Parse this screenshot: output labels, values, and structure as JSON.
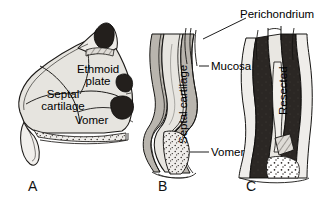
{
  "figure": {
    "background_color": "#ffffff",
    "ink_color": "#000000",
    "cartilage_fill": "#e3e1dc",
    "dark_fill": "#2b2724",
    "mucosa_fill": "#b9b5ae"
  },
  "panels": [
    {
      "letter": "A",
      "name": "septum-overview",
      "labels": [
        {
          "text": "Septal",
          "sub": "cartilage"
        },
        {
          "text": "Ethmoid",
          "sub": "plate"
        },
        {
          "text": "Vomer",
          "sub": ""
        }
      ]
    },
    {
      "letter": "B",
      "name": "septum-cross-section",
      "labels": [
        {
          "text": "Septal cartilage"
        },
        {
          "text": "Mucosa"
        },
        {
          "text": "Vomer"
        }
      ]
    },
    {
      "letter": "C",
      "name": "septum-resected",
      "labels": [
        {
          "text": "Perichondrium"
        },
        {
          "text": "Resected"
        }
      ]
    }
  ],
  "labels": {
    "septal_line1": "Septal",
    "septal_line2": "cartilage",
    "ethmoid_line1": "Ethmoid",
    "ethmoid_line2": "plate",
    "vomer_a": "Vomer",
    "septal_cartilage_b": "Septal cartilage",
    "mucosa": "Mucosa",
    "vomer_b": "Vomer",
    "perichondrium": "Perichondrium",
    "resected": "Resected",
    "panel_a": "A",
    "panel_b": "B",
    "panel_c": "C"
  }
}
